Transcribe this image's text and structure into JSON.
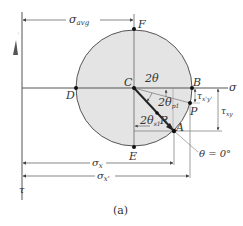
{
  "caption": "(a)",
  "axes": {
    "sigma_label": "σ",
    "tau_label": "τ"
  },
  "points": {
    "C": "C",
    "D": "D",
    "F": "F",
    "E": "E",
    "B": "B",
    "P": "P",
    "A": "A"
  },
  "dimensions": {
    "sigma_avg": "σ",
    "sigma_avg_sub": "avg",
    "sigma_x": "σ",
    "sigma_x_sub": "x",
    "sigma_x_prime": "σ",
    "sigma_x_prime_sub": "x'",
    "tau_xy": "τ",
    "tau_xy_sub": "xy",
    "tau_xprime_yprime": "τ",
    "tau_xprime_yprime_sub": "x'y'"
  },
  "angles": {
    "two_theta": "2θ",
    "two_theta_p1": "2θ",
    "two_theta_p1_sub": "p1",
    "two_theta_s1": "2θ",
    "two_theta_s1_sub": "s1",
    "radius": "R",
    "theta_zero": "θ = 0°"
  },
  "colors": {
    "circle_fill": "#e4e4e4",
    "line": "#555555",
    "dot": "#111111",
    "radius_line": "#222222"
  }
}
